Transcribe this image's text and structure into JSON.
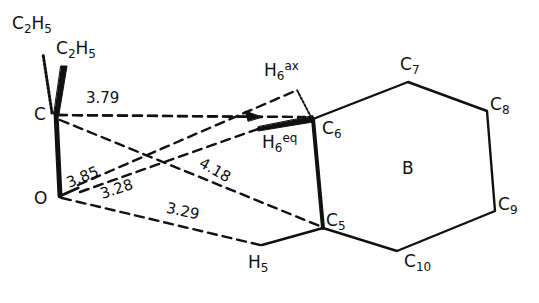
{
  "diagram": {
    "type": "molecular-geometry",
    "ring_label": "B",
    "atoms": {
      "ethyl_hashed": {
        "base": "C",
        "sub": "2",
        "base2": "H",
        "sub2": "5"
      },
      "ethyl_bold": {
        "base": "C",
        "sub": "2",
        "base2": "H",
        "sub2": "5"
      },
      "C": {
        "label": "C"
      },
      "O": {
        "label": "O"
      },
      "C5": {
        "base": "C",
        "sub": "5"
      },
      "C6": {
        "base": "C",
        "sub": "6"
      },
      "C7": {
        "base": "C",
        "sub": "7"
      },
      "C8": {
        "base": "C",
        "sub": "8"
      },
      "C9": {
        "base": "C",
        "sub": "9"
      },
      "C10": {
        "base": "C",
        "sub": "10"
      },
      "H5": {
        "base": "H",
        "sub": "5"
      },
      "H6ax": {
        "base": "H",
        "sub": "6",
        "sup": "ax"
      },
      "H6eq": {
        "base": "H",
        "sub": "6",
        "sup": "eq"
      }
    },
    "distances": [
      {
        "from": "C",
        "to": "H6eq",
        "value": "3.79"
      },
      {
        "from": "O",
        "to": "H6ax",
        "value": "3.85"
      },
      {
        "from": "O",
        "to": "H6eq",
        "value": "3.28"
      },
      {
        "from": "C",
        "to": "C5",
        "value": "4.18"
      },
      {
        "from": "O",
        "to": "H5",
        "value": "3.29"
      }
    ],
    "colors": {
      "ink": "#111111",
      "background": "#ffffff"
    }
  }
}
